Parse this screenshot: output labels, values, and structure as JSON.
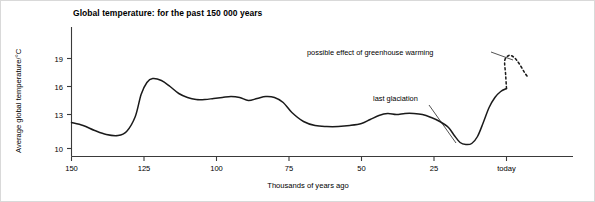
{
  "chart_data": {
    "type": "line",
    "title": "Global temperature: for the past 150 000 years",
    "xlabel": "Thousands of years ago",
    "ylabel": "Average global temperature/°C",
    "xlim": [
      150,
      -8
    ],
    "ylim": [
      9,
      20.5
    ],
    "x_ticks": [
      {
        "value": 150,
        "label": "150"
      },
      {
        "value": 125,
        "label": "125"
      },
      {
        "value": 100,
        "label": "100"
      },
      {
        "value": 75,
        "label": "75"
      },
      {
        "value": 50,
        "label": "50"
      },
      {
        "value": 25,
        "label": "25"
      },
      {
        "value": 0,
        "label": "today"
      }
    ],
    "y_ticks": [
      {
        "value": 10,
        "label": "10"
      },
      {
        "value": 13,
        "label": "13"
      },
      {
        "value": 16,
        "label": "16"
      },
      {
        "value": 19,
        "label": "19"
      }
    ],
    "grid": false,
    "legend": "none",
    "axis_direction": "x decreasing left to right (years before present)",
    "series": [
      {
        "name": "Observed average global temperature",
        "style": "solid",
        "x": [
          150,
          146,
          142,
          138,
          134,
          131,
          128,
          126,
          124,
          122,
          119,
          116,
          113,
          110,
          107,
          104,
          101,
          98,
          95,
          92,
          89,
          86,
          83,
          80,
          77,
          74,
          70,
          66,
          62,
          58,
          54,
          50,
          47,
          44,
          41,
          38,
          35,
          32,
          29,
          26,
          23,
          20,
          18,
          16,
          14,
          12,
          10,
          8,
          6,
          4,
          2,
          0
        ],
        "y": [
          12.6,
          12.3,
          11.8,
          11.4,
          11.3,
          11.7,
          13.2,
          15.4,
          16.6,
          17.0,
          16.8,
          16.2,
          15.5,
          15.1,
          14.9,
          14.9,
          15.0,
          15.1,
          15.2,
          15.1,
          14.8,
          15.0,
          15.2,
          15.1,
          14.6,
          13.6,
          12.7,
          12.3,
          12.2,
          12.2,
          12.3,
          12.5,
          12.9,
          13.3,
          13.5,
          13.4,
          13.5,
          13.5,
          13.4,
          13.1,
          12.7,
          12.1,
          11.3,
          10.6,
          10.4,
          10.5,
          11.2,
          12.6,
          14.1,
          15.1,
          15.7,
          16.0
        ]
      },
      {
        "name": "Projected warming",
        "style": "dashed",
        "x": [
          0,
          0.3,
          0.6,
          -0.8,
          -2.2,
          -3.6,
          -5.0,
          -6.2,
          -7.2
        ],
        "y": [
          16.0,
          17.4,
          18.8,
          19.3,
          19.2,
          18.8,
          18.2,
          17.6,
          17.2
        ]
      }
    ],
    "annotations": [
      {
        "id": "greenhouse-warming",
        "text": "possible effect of greenhouse warming",
        "points_to": "projected dashed curve peak"
      },
      {
        "id": "last-glaciation",
        "text": "last glaciation",
        "points_to": "temperature minimum around 16 thousand years ago"
      }
    ],
    "colors": {
      "curve": "#1a1a1a",
      "axis": "#3a3a3a",
      "text": "#1a1a1a",
      "background": "#ffffff",
      "frame": "#d9d9d9"
    }
  }
}
